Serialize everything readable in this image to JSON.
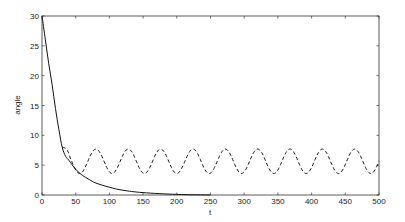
{
  "chart_data": {
    "type": "line",
    "title": "",
    "xlabel": "t",
    "ylabel": "angle",
    "xlim": [
      0,
      500
    ],
    "ylim": [
      0,
      30
    ],
    "xticks": [
      0,
      50,
      100,
      150,
      200,
      250,
      300,
      350,
      400,
      450,
      500
    ],
    "yticks": [
      0,
      5,
      10,
      15,
      20,
      25,
      30
    ],
    "grid": false,
    "legend": null,
    "series": [
      {
        "name": "solid",
        "style": "solid",
        "color": "#111111",
        "x": [
          0,
          5,
          10,
          15,
          20,
          25,
          30,
          35,
          40,
          50,
          60,
          70,
          80,
          100,
          120,
          150,
          200,
          250
        ],
        "y": [
          30,
          26,
          22,
          18.5,
          14.5,
          11,
          8,
          6.5,
          5.8,
          4.3,
          3.3,
          2.6,
          2.0,
          1.3,
          0.8,
          0.4,
          0.1,
          0.0
        ]
      },
      {
        "name": "dashed",
        "style": "dashed",
        "color": "#111111",
        "x_start": 30,
        "x_end": 500,
        "mean": 5.65,
        "amplitude": 2.05,
        "period": 48,
        "first_peak_t": 80,
        "y_start": 8.0
      }
    ]
  }
}
